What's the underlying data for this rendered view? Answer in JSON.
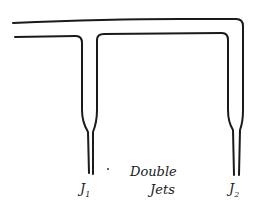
{
  "diagram": {
    "title_line1": "Double",
    "title_line2": "Jets",
    "jet1": {
      "letter": "J",
      "index": "1"
    },
    "jet2": {
      "letter": "J",
      "index": "2"
    },
    "stroke_color": "#1a1a1a",
    "background": "#ffffff"
  }
}
